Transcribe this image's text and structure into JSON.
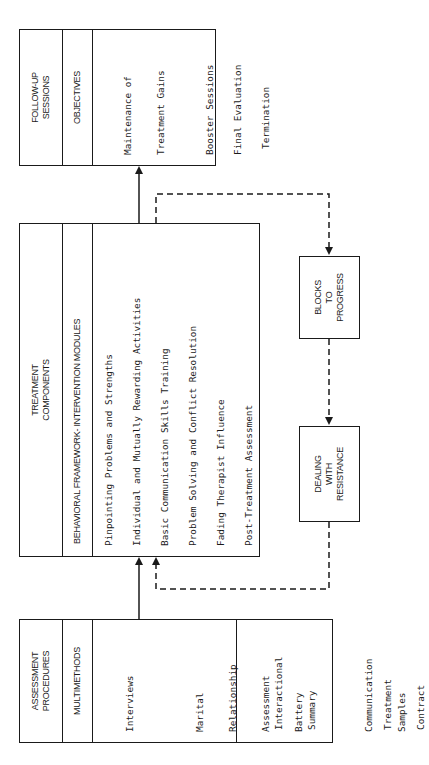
{
  "follow_up": {
    "title_line1": "FOLLOW-UP",
    "title_line2": "SESSIONS",
    "subheader": "OBJECTIVES",
    "items": [
      {
        "line1": "Maintenance of",
        "line2": "Treatment Gains"
      },
      {
        "line1": "Booster Sessions"
      },
      {
        "line1": "Final Evaluation"
      },
      {
        "line1": "Termination"
      }
    ]
  },
  "treatment": {
    "title_line1": "TREATMENT",
    "title_line2": "COMPONENTS",
    "subheader": "BEHAVIORAL FRAMEWORK- INTERVENTION MODULES",
    "items": [
      "Pinpointing Problems and Strengths",
      "Individual and Mutually Rewarding Activities",
      "Basic Communication Skills Training",
      "Problem Solving and Conflict Resolution",
      "Fading Therapist Influence",
      "Post-Treatment Assessment"
    ]
  },
  "blocks": {
    "line1": "BLOCKS",
    "line2": "TO",
    "line3": "PROGRESS"
  },
  "resistance": {
    "line1": "DEALING",
    "line2": "WITH",
    "line3": "RESISTANCE"
  },
  "assessment": {
    "title_line1": "ASSESSMENT",
    "title_line2": "PROCEDURES",
    "subheader": "MULTIMETHODS",
    "methods": [
      {
        "lines": [
          "Interviews"
        ]
      },
      {
        "lines": [
          "Marital",
          "Relationship",
          "Assessment",
          "Battery"
        ]
      },
      {
        "lines": [
          "Communication",
          "Samples"
        ]
      }
    ],
    "outcomes": [
      {
        "lines": [
          "Interactional",
          "Summary"
        ]
      },
      {
        "lines": [
          "Treatment",
          "Contract"
        ]
      }
    ]
  }
}
